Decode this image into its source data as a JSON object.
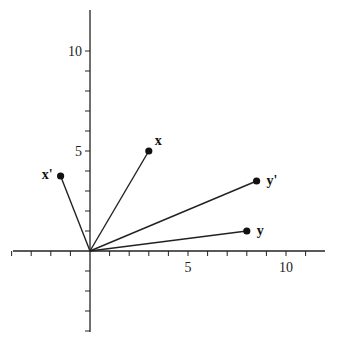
{
  "chart_data": {
    "type": "scatter",
    "title": "",
    "xlabel": "",
    "ylabel": "",
    "xlim": [
      -4,
      12
    ],
    "ylim": [
      -4,
      12
    ],
    "grid": false,
    "x_tick_labels": [
      "5",
      "10"
    ],
    "y_tick_labels": [
      "5",
      "10"
    ],
    "vectors": [
      {
        "label": "x",
        "x": 3,
        "y": 5
      },
      {
        "label": "x'",
        "x": -1.5,
        "y": 3.75
      },
      {
        "label": "y'",
        "x": 8.5,
        "y": 3.5
      },
      {
        "label": "y",
        "x": 8,
        "y": 1
      }
    ],
    "style": {
      "line_color": "#222222",
      "point_color": "#111111"
    }
  }
}
